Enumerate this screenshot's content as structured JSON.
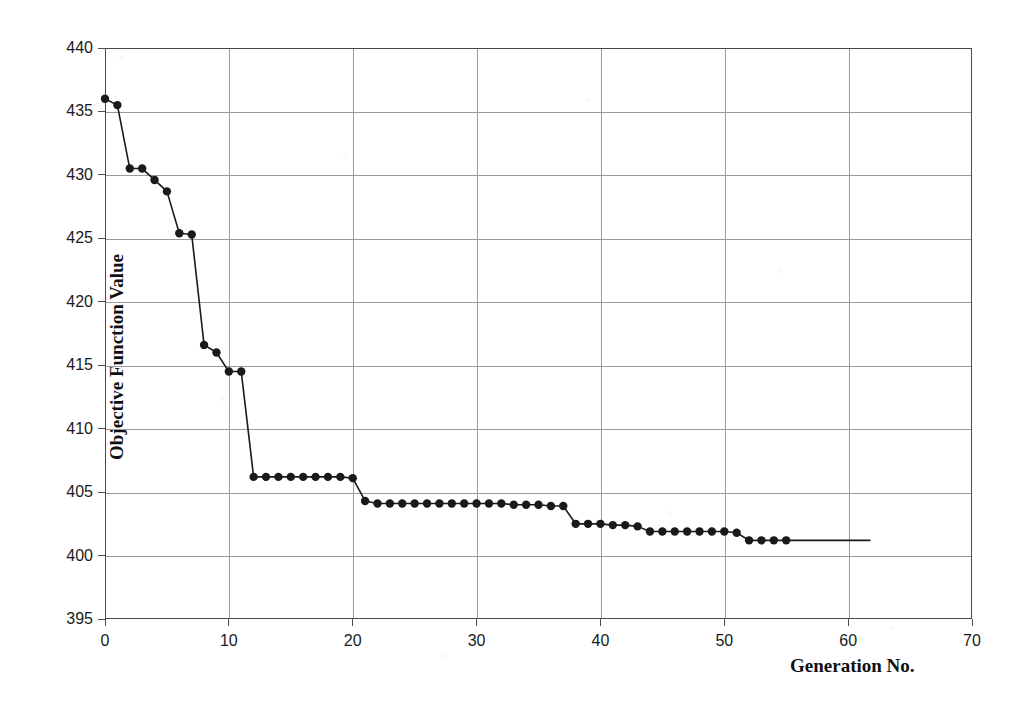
{
  "chart_data": {
    "type": "line",
    "title": "",
    "xlabel": "Generation No.",
    "ylabel": "Objective Function Value",
    "xlim": [
      0,
      70
    ],
    "ylim": [
      395,
      440
    ],
    "xticks": [
      0,
      10,
      20,
      30,
      40,
      50,
      60,
      70
    ],
    "yticks": [
      395,
      400,
      405,
      410,
      415,
      420,
      425,
      430,
      435,
      440
    ],
    "grid": true,
    "legend": "none",
    "marker": "filled-circle",
    "line_color": "#1a1a1a",
    "marker_color": "#1a1a1a",
    "grid_color": "#9a9a9a",
    "series": [
      {
        "name": "Best objective function value",
        "x": [
          0,
          1,
          2,
          3,
          4,
          5,
          6,
          7,
          8,
          9,
          10,
          11,
          12,
          13,
          14,
          15,
          16,
          17,
          18,
          19,
          20,
          21,
          22,
          23,
          24,
          25,
          26,
          27,
          28,
          29,
          30,
          31,
          32,
          33,
          34,
          35,
          36,
          37,
          38,
          39,
          40,
          41,
          42,
          43,
          44,
          45,
          46,
          47,
          48,
          49,
          50,
          51,
          52,
          53,
          54,
          55
        ],
        "y": [
          436.0,
          435.5,
          430.5,
          430.5,
          429.6,
          428.7,
          425.4,
          425.3,
          416.6,
          416.0,
          414.5,
          414.5,
          406.2,
          406.2,
          406.2,
          406.2,
          406.2,
          406.2,
          406.2,
          406.2,
          406.1,
          404.3,
          404.1,
          404.1,
          404.1,
          404.1,
          404.1,
          404.1,
          404.1,
          404.1,
          404.1,
          404.1,
          404.1,
          404.0,
          404.0,
          404.0,
          403.9,
          403.9,
          402.5,
          402.5,
          402.5,
          402.4,
          402.4,
          402.3,
          401.9,
          401.9,
          401.9,
          401.9,
          401.9,
          401.9,
          401.9,
          401.8,
          401.2,
          401.2,
          401.2,
          401.2
        ]
      }
    ],
    "tail_segment": {
      "note": "flat line continues past last marker",
      "x_from": 55,
      "x_to": 61.8,
      "y": 401.2
    }
  },
  "axis": {
    "y_tick_labels": [
      "440",
      "435",
      "430",
      "425",
      "420",
      "415",
      "410",
      "405",
      "400",
      "395"
    ],
    "x_tick_labels": [
      "0",
      "10",
      "20",
      "30",
      "40",
      "50",
      "60",
      "70"
    ],
    "y_title": "Objective Function Value",
    "x_title": "Generation No."
  }
}
